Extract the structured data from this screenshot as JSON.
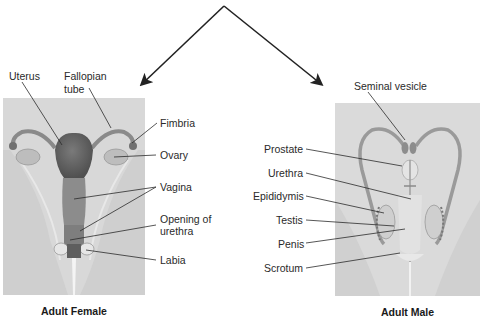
{
  "diagram": {
    "colors": {
      "panel_bg": "#d6d6d6",
      "organ_dark": "#6b6b6b",
      "organ_mid": "#9a9a9a",
      "organ_light": "#c4c4c4",
      "line": "#2b2b2b"
    },
    "female": {
      "caption": "Adult Female",
      "labels": {
        "uterus": "Uterus",
        "fallopian_tube_1": "Fallopian",
        "fallopian_tube_2": "tube",
        "fimbria": "Fimbria",
        "ovary": "Ovary",
        "vagina": "Vagina",
        "opening_1": "Opening of",
        "opening_2": "urethra",
        "labia": "Labia"
      }
    },
    "male": {
      "caption": "Adult Male",
      "labels": {
        "seminal_vesicle": "Seminal vesicle",
        "prostate": "Prostate",
        "urethra": "Urethra",
        "epididymis": "Epididymis",
        "testis": "Testis",
        "penis": "Penis",
        "scrotum": "Scrotum"
      }
    }
  }
}
